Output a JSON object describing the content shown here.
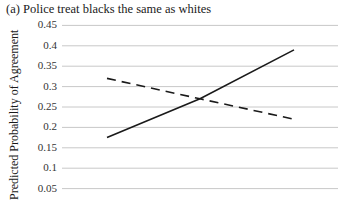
{
  "chart_data": {
    "type": "line",
    "title": "(a) Police treat blacks the same as whites",
    "xlabel": "",
    "ylabel": "Predicted Probability of Agreement",
    "ylim": [
      0,
      0.45
    ],
    "yticks": [
      "0.45",
      "0.4",
      "0.35",
      "0.3",
      "0.25",
      "0.2",
      "0.15",
      "0.1",
      "0.05"
    ],
    "grid": true,
    "x": [
      0,
      1,
      2
    ],
    "series": [
      {
        "name": "solid",
        "style": "solid",
        "values": [
          0.175,
          0.27,
          0.39
        ]
      },
      {
        "name": "dashed",
        "style": "dashed",
        "values": [
          0.32,
          0.27,
          0.22
        ]
      }
    ]
  },
  "colors": {
    "line": "#1a1a1a",
    "grid": "#c8c8c8"
  }
}
